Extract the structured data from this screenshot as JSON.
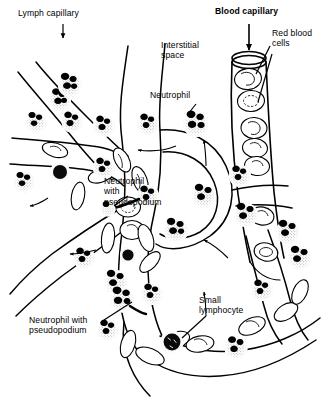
{
  "figure": {
    "background_color": "#ffffff",
    "ink_color": "#000000",
    "width": 326,
    "height": 412
  },
  "labels": [
    {
      "id": "lymph-capillary",
      "text": "Lymph capillary",
      "bold": false,
      "x": 18,
      "y": 12,
      "align": "left",
      "pointer": "down-arrow"
    },
    {
      "id": "blood-capillary",
      "text": "Blood capillary",
      "bold": true,
      "x": 215,
      "y": 10,
      "align": "left",
      "pointer": "down-arrow"
    },
    {
      "id": "red-blood-cells",
      "text": "Red blood\ncells",
      "bold": false,
      "x": 272,
      "y": 29,
      "align": "left",
      "pointer": "leader-lines"
    },
    {
      "id": "interstitial-space",
      "text": "Interstitial\nspace",
      "bold": false,
      "x": 161,
      "y": 40,
      "align": "left",
      "pointer": "none"
    },
    {
      "id": "neutrophil",
      "text": "Neutrophil",
      "bold": false,
      "x": 150,
      "y": 92,
      "align": "left",
      "pointer": "leader-line"
    },
    {
      "id": "neutrophil-with-pseudopodium-upper",
      "text": "Neutrophil\nwith\npseudopodium",
      "bold": false,
      "x": 104,
      "y": 178,
      "align": "left",
      "pointer": "leader-line"
    },
    {
      "id": "small-lymphocyte",
      "text": "Small\nlymphocyte",
      "bold": false,
      "x": 199,
      "y": 297,
      "align": "left",
      "pointer": "leader-line"
    },
    {
      "id": "neutrophil-with-pseudopodium-lower",
      "text": "Neutrophil with\npseudopodium",
      "bold": false,
      "x": 29,
      "y": 317,
      "align": "left",
      "pointer": "leader-line"
    }
  ],
  "structures": {
    "lymph_capillary_name": "lymph-capillary-network",
    "blood_capillary_name": "blood-capillary-tube",
    "interstitial_space_name": "interstitial-space-region"
  },
  "cells": {
    "neutrophil_label": "neutrophil-cell",
    "lymphocyte_label": "small-lymphocyte-cell",
    "red_blood_cell_label": "red-blood-cell",
    "neutrophil_count_visible": 22,
    "lymphocyte_count_visible": 2,
    "red_blood_cell_count_visible": 16
  }
}
